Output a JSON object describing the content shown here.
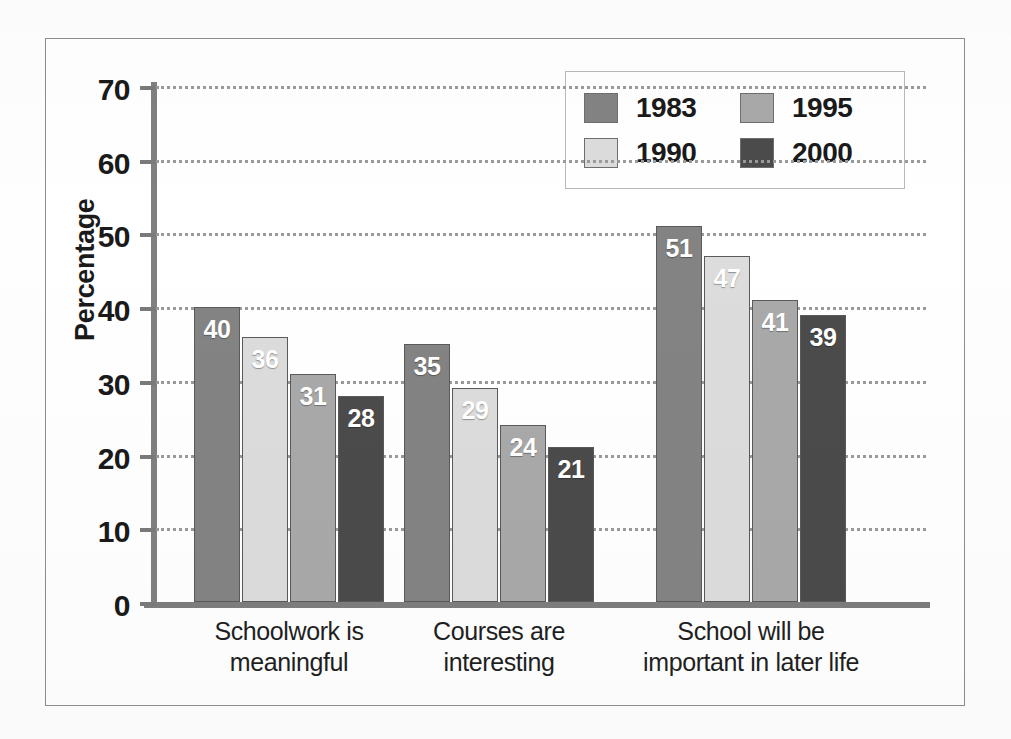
{
  "chart_data": {
    "type": "bar",
    "title": "",
    "subtitle": "",
    "xlabel": "",
    "ylabel": "Percentage",
    "ylim": [
      0,
      70
    ],
    "ytick_labels": [
      "0",
      "10",
      "20",
      "30",
      "40",
      "50",
      "60",
      "70"
    ],
    "ytick_values": [
      0,
      10,
      20,
      30,
      40,
      50,
      60,
      70
    ],
    "grid": "horizontal-dotted",
    "legend_position": "top-right",
    "categories": [
      "Schoolwork is\nmeaningful",
      "Courses are\ninteresting",
      "School will be\nimportant in later life"
    ],
    "series": [
      {
        "name": "1983",
        "color": "#838383",
        "values": [
          40,
          35,
          51
        ]
      },
      {
        "name": "1990",
        "color": "#dcdcdc",
        "values": [
          36,
          29,
          47
        ]
      },
      {
        "name": "1995",
        "color": "#a9a9a9",
        "values": [
          31,
          24,
          41
        ]
      },
      {
        "name": "2000",
        "color": "#4b4b4b",
        "values": [
          28,
          21,
          39
        ]
      }
    ]
  },
  "legend": {
    "items": [
      {
        "label": "1983",
        "color": "#838383"
      },
      {
        "label": "1995",
        "color": "#a9a9a9"
      },
      {
        "label": "1990",
        "color": "#dcdcdc"
      },
      {
        "label": "2000",
        "color": "#4b4b4b"
      }
    ]
  },
  "axis": {
    "y_title": "Percentage"
  },
  "colors": {
    "frame": "#8d8d8d",
    "gridline": "#9a9a9a",
    "axis": "#7d7d7d",
    "label_text": "#1a1a1a",
    "value_text": "#ffffff"
  }
}
